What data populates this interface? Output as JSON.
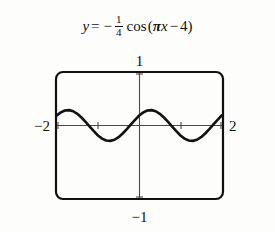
{
  "equation": {
    "lhs": "y",
    "equals": "=",
    "minus": "−",
    "fraction_numerator": "1",
    "fraction_denominator": "4",
    "function_name": "cos",
    "open_paren": "(",
    "pi": "π",
    "x_var": "x",
    "inner_minus": "−",
    "phase_constant": "4",
    "close_paren": ")",
    "plain_text": "y = -1/4 cos (πx - 4)"
  },
  "graph": {
    "labels": {
      "top": "1",
      "bottom": "−1",
      "left": "−2",
      "right": "2"
    },
    "colors": {
      "ink": "#111111",
      "axis": "#3a3a3a",
      "background": "#fdfdfb"
    }
  },
  "chart_data": {
    "type": "line",
    "xlabel": "",
    "ylabel": "",
    "xlim": [
      -2,
      2
    ],
    "ylim": [
      -1,
      1
    ],
    "xticks": [
      -2,
      -1,
      0,
      1,
      2
    ],
    "yticks": [
      -1,
      0,
      1
    ],
    "xtick_labels": [
      "−2",
      "",
      "",
      "",
      "2"
    ],
    "ytick_labels": [
      "−1",
      "",
      "1"
    ],
    "grid": false,
    "legend": null,
    "series": [
      {
        "name": "y = -1/4 cos(πx - 4)",
        "expression": "-0.25*cos(pi*x - 4)",
        "amplitude": 0.25,
        "period": 2,
        "phase_shift": 1.2732,
        "x": [
          -2.0,
          -1.9,
          -1.8,
          -1.7,
          -1.6,
          -1.5,
          -1.4,
          -1.3,
          -1.2,
          -1.1,
          -1.0,
          -0.9,
          -0.8,
          -0.7,
          -0.6,
          -0.5,
          -0.4,
          -0.3,
          -0.2,
          -0.1,
          0.0,
          0.1,
          0.2,
          0.3,
          0.4,
          0.5,
          0.6,
          0.7,
          0.8,
          0.9,
          1.0,
          1.1,
          1.2,
          1.3,
          1.4,
          1.5,
          1.6,
          1.7,
          1.8,
          1.9,
          2.0
        ],
        "y": [
          0.163,
          0.213,
          0.244,
          0.25,
          0.232,
          0.19,
          0.13,
          0.058,
          -0.018,
          -0.093,
          -0.163,
          -0.213,
          -0.244,
          -0.25,
          -0.232,
          -0.19,
          -0.13,
          -0.058,
          0.018,
          0.093,
          0.163,
          0.213,
          0.244,
          0.25,
          0.232,
          0.19,
          0.13,
          0.058,
          -0.018,
          -0.093,
          -0.163,
          -0.213,
          -0.244,
          -0.25,
          -0.232,
          -0.19,
          -0.13,
          -0.058,
          0.018,
          0.093,
          0.163
        ],
        "maxima_x": [
          -1.7268,
          0.2732
        ],
        "minima_x": [
          -0.7268,
          1.2732
        ],
        "max_value": 0.25,
        "min_value": -0.25
      }
    ]
  }
}
